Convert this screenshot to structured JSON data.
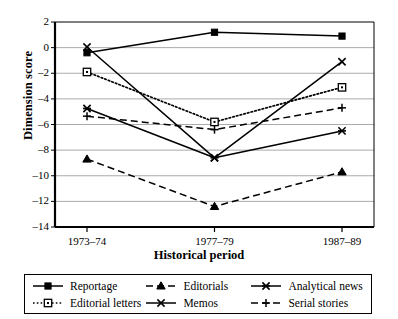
{
  "chart_data": {
    "type": "line",
    "title": "",
    "xlabel": "Historical period",
    "ylabel": "Dimension score",
    "categories": [
      "1973–74",
      "1977–79",
      "1987–89"
    ],
    "ylim": [
      -14,
      2
    ],
    "ytick_step": 2,
    "yticks": [
      "2",
      "0",
      "–2",
      "–4",
      "–6",
      "–8",
      "–10",
      "–12",
      "–14"
    ],
    "ytick_values": [
      2,
      0,
      -2,
      -4,
      -6,
      -8,
      -10,
      -12,
      -14
    ],
    "grid": "horizontal",
    "legend_position": "bottom",
    "series": [
      {
        "name": "Reportage",
        "values": [
          -0.4,
          1.2,
          0.9
        ],
        "marker": "filled-square",
        "line": "solid",
        "color": "#000000"
      },
      {
        "name": "Editorial letters",
        "values": [
          -1.9,
          -5.8,
          -3.1
        ],
        "marker": "open-square",
        "line": "dotted",
        "color": "#000000"
      },
      {
        "name": "Editorials",
        "values": [
          -8.7,
          -12.4,
          -9.7
        ],
        "marker": "filled-triangle",
        "line": "dashed",
        "color": "#000000"
      },
      {
        "name": "Memos",
        "values": [
          0.05,
          -8.6,
          -1.1
        ],
        "marker": "x-cross",
        "line": "solid",
        "color": "#000000"
      },
      {
        "name": "Analytical news",
        "values": [
          -4.75,
          -8.6,
          -6.5
        ],
        "marker": "star-x",
        "line": "solid",
        "color": "#000000"
      },
      {
        "name": "Serial stories",
        "values": [
          -5.35,
          -6.4,
          -4.7
        ],
        "marker": "plus",
        "line": "dashed",
        "color": "#000000"
      }
    ]
  },
  "legend": {
    "entries": [
      {
        "label": "Reportage"
      },
      {
        "label": "Editorials"
      },
      {
        "label": "Analytical news"
      },
      {
        "label": "Editorial letters"
      },
      {
        "label": "Memos"
      },
      {
        "label": "Serial stories"
      }
    ]
  },
  "axes": {
    "y_title": "Dimension score",
    "x_title": "Historical period"
  }
}
